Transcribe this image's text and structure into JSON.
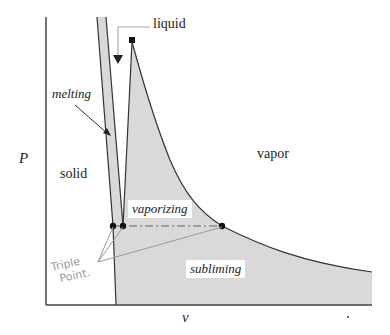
{
  "diagram": {
    "axes": {
      "y_label": "P",
      "x_label": "v"
    },
    "regions": {
      "solid": "solid",
      "vapor": "vapor",
      "vaporizing": "vaporizing",
      "subliming": "subliming"
    },
    "annotations": {
      "liquid": "liquid",
      "melting": "melting",
      "triple_point_line1": "Triple",
      "triple_point_line2": "Point."
    },
    "colors": {
      "fill": "#d9d9d9",
      "line": "#333333",
      "axis": "#444444",
      "handwriting": "#9a9a9a",
      "point": "#111111"
    },
    "points": {
      "critical_point": [
        132,
        40
      ],
      "triple_points": [
        [
          113,
          226
        ],
        [
          123,
          226
        ],
        [
          222,
          226
        ]
      ]
    }
  }
}
